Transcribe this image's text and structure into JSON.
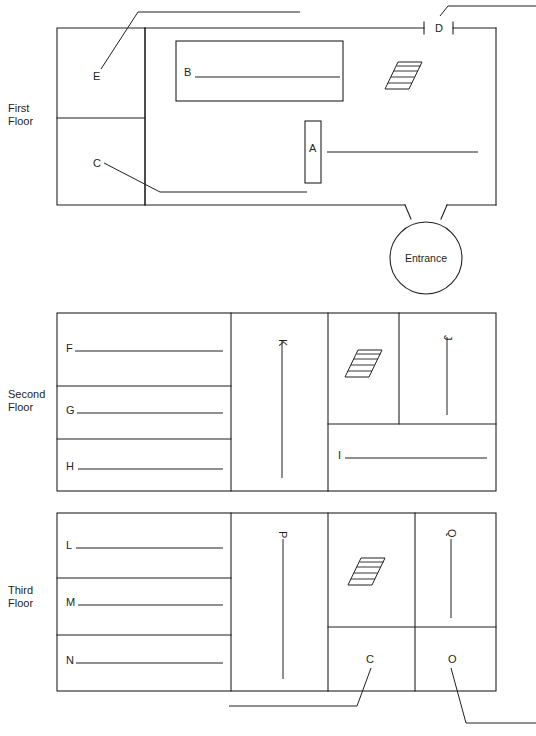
{
  "diagram": {
    "line_color": "#231f20",
    "background_color": "#ffffff"
  },
  "floors": [
    {
      "id": "first",
      "label_line1": "First",
      "label_line2": "Floor",
      "rooms": [
        {
          "key": "E",
          "label": "E",
          "has_leader": true,
          "has_rule": false
        },
        {
          "key": "C",
          "label": "C",
          "has_leader": true,
          "has_rule": false
        },
        {
          "key": "B",
          "label": "B",
          "has_leader": false,
          "has_rule": true
        },
        {
          "key": "A",
          "label": "A",
          "has_leader": false,
          "has_rule": true
        },
        {
          "key": "D",
          "label": "D",
          "has_leader": true,
          "has_rule": false
        }
      ],
      "features": [
        {
          "name": "stairs",
          "label": "stairs-icon"
        },
        {
          "name": "entrance",
          "label": "Entrance"
        }
      ]
    },
    {
      "id": "second",
      "label_line1": "Second",
      "label_line2": "Floor",
      "rooms": [
        {
          "key": "F",
          "label": "F",
          "has_leader": false,
          "has_rule": true
        },
        {
          "key": "G",
          "label": "G",
          "has_leader": false,
          "has_rule": true
        },
        {
          "key": "H",
          "label": "H",
          "has_leader": false,
          "has_rule": true
        },
        {
          "key": "K",
          "label": "K",
          "has_leader": false,
          "has_rule": true,
          "rotated": true
        },
        {
          "key": "J",
          "label": "J",
          "has_leader": false,
          "has_rule": true,
          "rotated": true
        },
        {
          "key": "I",
          "label": "I",
          "has_leader": false,
          "has_rule": true
        }
      ],
      "features": [
        {
          "name": "stairs",
          "label": "stairs-icon"
        }
      ]
    },
    {
      "id": "third",
      "label_line1": "Third",
      "label_line2": "Floor",
      "rooms": [
        {
          "key": "L",
          "label": "L",
          "has_leader": false,
          "has_rule": true
        },
        {
          "key": "M",
          "label": "M",
          "has_leader": false,
          "has_rule": true
        },
        {
          "key": "N",
          "label": "N",
          "has_leader": false,
          "has_rule": true
        },
        {
          "key": "P",
          "label": "P",
          "has_leader": false,
          "has_rule": true,
          "rotated": true
        },
        {
          "key": "Q",
          "label": "Q",
          "has_leader": false,
          "has_rule": true,
          "rotated": true
        },
        {
          "key": "C3",
          "label": "C",
          "has_leader": true,
          "has_rule": false
        },
        {
          "key": "O",
          "label": "O",
          "has_leader": true,
          "has_rule": false
        }
      ],
      "features": [
        {
          "name": "stairs",
          "label": "stairs-icon"
        }
      ]
    }
  ],
  "labels": {
    "first_floor_line1": "First",
    "first_floor_line2": "Floor",
    "second_floor_line1": "Second",
    "second_floor_line2": "Floor",
    "third_floor_line1": "Third",
    "third_floor_line2": "Floor",
    "entrance": "Entrance",
    "A": "A",
    "B": "B",
    "C": "C",
    "D": "D",
    "E": "E",
    "F": "F",
    "G": "G",
    "H": "H",
    "I": "I",
    "J": "J",
    "K": "K",
    "L": "L",
    "M": "M",
    "N": "N",
    "O": "O",
    "P": "P",
    "Q": "Q",
    "C_third": "C"
  }
}
